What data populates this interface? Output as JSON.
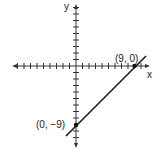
{
  "diagram": {
    "type": "coordinate-plane-line",
    "axes": {
      "x_label": "x",
      "y_label": "y",
      "x_ticks_each_side": 9,
      "y_ticks_each_side": 9
    },
    "line": {
      "equation": "y = x - 9",
      "color": "#1a1a1a"
    },
    "points": [
      {
        "label": "(9, 0)",
        "x": 9,
        "y": 0
      },
      {
        "label": "(0, −9)",
        "x": 0,
        "y": -9
      }
    ]
  }
}
